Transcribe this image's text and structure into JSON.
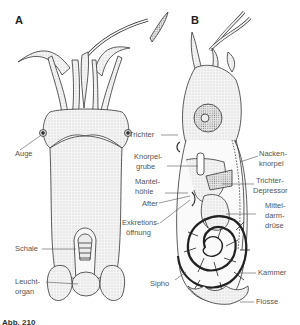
{
  "figure": {
    "panels": [
      {
        "id": "A",
        "letter": "A",
        "labels": {
          "auge": "Auge",
          "schale": "Schale",
          "leuchtorgan_1": "Leucht-",
          "leuchtorgan_2": "organ"
        }
      },
      {
        "id": "B",
        "letter": "B",
        "labels": {
          "trichter": "Trichter",
          "knorpelgrube_1": "Knorpel-",
          "knorpelgrube_2": "grube",
          "mantelhoehle_1": "Mantel-",
          "mantelhoehle_2": "höhle",
          "after": "After",
          "exkretion_1": "Exkretions-",
          "exkretion_2": "öffnung",
          "sipho": "Sipho",
          "nackenknorpel_1": "Nacken-",
          "nackenknorpel_2": "knorpel",
          "trichterdepressor_1": "Trichter-",
          "trichterdepressor_2": "Depressor",
          "mitteldarmdruese_1": "Mittel-",
          "mitteldarmdruese_2": "darm-",
          "mitteldarmdruese_3": "drüse",
          "kammer": "Kammer",
          "flosse": "Flosse"
        }
      }
    ],
    "caption": {
      "number": "Abb. 210",
      "text": "(caption cut off at image edge)"
    },
    "colors": {
      "ink": "#2a2a2a",
      "stipple": "#9a9a9a",
      "label": "#555555"
    }
  }
}
